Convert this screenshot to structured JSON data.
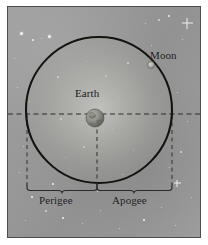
{
  "figure": {
    "kind": "moon-orbit-diagram",
    "panel": {
      "background_color": "#9a9a9a",
      "border_color": "#4c4c4c"
    }
  },
  "labels": {
    "moon": "Moon",
    "earth": "Earth",
    "perigee": "Perigee",
    "apogee": "Apogee"
  },
  "diagram_data": {
    "type": "diagram",
    "orbit": {
      "shape": "circle",
      "center_x": 99,
      "center_y": 110,
      "radius": 73,
      "stroke_color": "#15130f",
      "stroke_width": 2
    },
    "earth": {
      "center_x": 95,
      "center_y": 118,
      "radius": 9,
      "body_color": "#8c8c86"
    },
    "moon": {
      "center_x": 151,
      "center_y": 65,
      "radius": 3,
      "body_color": "#b4b4ae"
    },
    "axis_line": {
      "orientation": "horizontal",
      "y": 114,
      "x_start": 8,
      "x_end": 200,
      "style": "dashed",
      "color": "#2b2b2b"
    },
    "drop_lines": [
      {
        "name": "perigee-left-drop",
        "x": 27,
        "y_start": 115,
        "y_end": 183,
        "style": "dashed"
      },
      {
        "name": "center-drop",
        "x": 97,
        "y_start": 120,
        "y_end": 183,
        "style": "dashed"
      },
      {
        "name": "apogee-right-drop",
        "x": 172,
        "y_start": 115,
        "y_end": 183,
        "style": "dashed"
      }
    ],
    "braces": [
      {
        "name": "perigee-brace",
        "x_start": 27,
        "x_end": 97,
        "y": 186,
        "label": "Perigee"
      },
      {
        "name": "apogee-brace",
        "x_start": 97,
        "x_end": 172,
        "y": 186,
        "label": "Apogee"
      }
    ],
    "stars": [
      {
        "x": 20,
        "y": 32,
        "size": 3,
        "soft": false
      },
      {
        "x": 32,
        "y": 39,
        "size": 2,
        "soft": false
      },
      {
        "x": 48,
        "y": 35,
        "size": 3,
        "soft": false
      },
      {
        "x": 40,
        "y": 37,
        "size": 1,
        "soft": true
      },
      {
        "x": 13,
        "y": 57,
        "size": 1,
        "soft": true
      },
      {
        "x": 16,
        "y": 86,
        "size": 1,
        "soft": true
      },
      {
        "x": 28,
        "y": 100,
        "size": 1,
        "soft": true
      },
      {
        "x": 22,
        "y": 145,
        "size": 1,
        "soft": true
      },
      {
        "x": 18,
        "y": 171,
        "size": 1,
        "soft": true
      },
      {
        "x": 31,
        "y": 196,
        "size": 2,
        "soft": false
      },
      {
        "x": 45,
        "y": 210,
        "size": 2,
        "soft": true
      },
      {
        "x": 24,
        "y": 219,
        "size": 1,
        "soft": true
      },
      {
        "x": 62,
        "y": 217,
        "size": 2,
        "soft": false
      },
      {
        "x": 81,
        "y": 222,
        "size": 1,
        "soft": true
      },
      {
        "x": 99,
        "y": 209,
        "size": 1,
        "soft": true
      },
      {
        "x": 52,
        "y": 183,
        "size": 2,
        "soft": false
      },
      {
        "x": 64,
        "y": 156,
        "size": 1,
        "soft": true
      },
      {
        "x": 83,
        "y": 146,
        "size": 2,
        "soft": false
      },
      {
        "x": 60,
        "y": 118,
        "size": 2,
        "soft": false
      },
      {
        "x": 57,
        "y": 76,
        "size": 2,
        "soft": false
      },
      {
        "x": 85,
        "y": 60,
        "size": 1,
        "soft": true
      },
      {
        "x": 105,
        "y": 75,
        "size": 2,
        "soft": false
      },
      {
        "x": 118,
        "y": 97,
        "size": 1,
        "soft": true
      },
      {
        "x": 127,
        "y": 62,
        "size": 2,
        "soft": false
      },
      {
        "x": 111,
        "y": 127,
        "size": 1,
        "soft": true
      },
      {
        "x": 132,
        "y": 148,
        "size": 1,
        "soft": true
      },
      {
        "x": 121,
        "y": 173,
        "size": 1,
        "soft": true
      },
      {
        "x": 150,
        "y": 44,
        "size": 1,
        "soft": true
      },
      {
        "x": 158,
        "y": 19,
        "size": 2,
        "soft": true
      },
      {
        "x": 168,
        "y": 15,
        "size": 2,
        "soft": false
      },
      {
        "x": 144,
        "y": 22,
        "size": 1,
        "soft": true
      },
      {
        "x": 181,
        "y": 38,
        "size": 1,
        "soft": true
      },
      {
        "x": 176,
        "y": 91,
        "size": 1,
        "soft": true
      },
      {
        "x": 186,
        "y": 120,
        "size": 1,
        "soft": true
      },
      {
        "x": 180,
        "y": 151,
        "size": 2,
        "soft": true
      },
      {
        "x": 168,
        "y": 166,
        "size": 1,
        "soft": true
      },
      {
        "x": 190,
        "y": 196,
        "size": 1,
        "soft": true
      },
      {
        "x": 160,
        "y": 206,
        "size": 1,
        "soft": true
      },
      {
        "x": 174,
        "y": 224,
        "size": 1,
        "soft": true
      },
      {
        "x": 143,
        "y": 219,
        "size": 2,
        "soft": false
      },
      {
        "x": 118,
        "y": 227,
        "size": 1,
        "soft": true
      },
      {
        "x": 96,
        "y": 190,
        "size": 1,
        "soft": true
      }
    ],
    "spike_stars": [
      {
        "x": 186,
        "y": 22,
        "size": 11
      },
      {
        "x": 176,
        "y": 182,
        "size": 7
      }
    ]
  }
}
